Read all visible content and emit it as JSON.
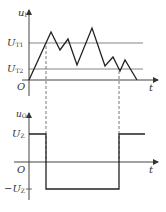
{
  "top_graph": {
    "y_label": "u",
    "y_label_sub": "I",
    "x_label": "t",
    "origin_label": "O",
    "thresholds": [
      {
        "name": "U",
        "sub": "T1",
        "y": 43
      },
      {
        "name": "U",
        "sub": "T2",
        "y": 69
      }
    ],
    "waveform_points": "29,80 51,32 60,50 68,39 77,65 92,28 105,66 113,57 120,71 125,60 137,80"
  },
  "bottom_graph": {
    "y_label": "u",
    "y_label_sub": "O",
    "x_label": "t",
    "origin_label": "O",
    "high_label": "U",
    "high_sub": "Z",
    "low_label": "−U",
    "low_sub": "Z",
    "waveform_points": "29,134 46,134 46,189 119,189 119,134 145,134"
  },
  "dashed_markers_x": [
    46,
    119
  ],
  "colors": {
    "line": "#222222",
    "axis": "#444444",
    "threshold": "#666666",
    "dash": "#555555"
  }
}
